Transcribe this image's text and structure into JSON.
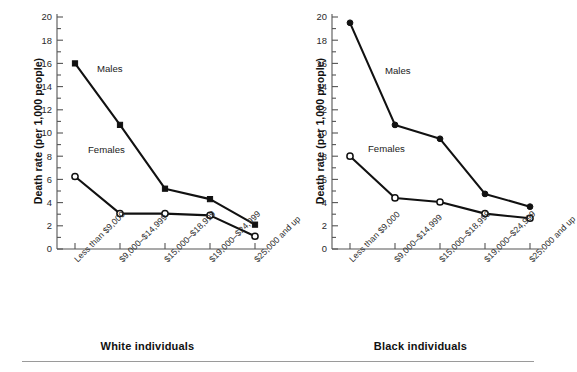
{
  "figure": {
    "rule_color": "#9a9a9a",
    "line_color": "#111111",
    "axis_color": "#555555"
  },
  "chart_data": [
    {
      "type": "line",
      "title": "White individuals",
      "xlabel": "",
      "ylabel": "Death rate (per 1,000 people)",
      "ylim": [
        0,
        20
      ],
      "ytick_step": 2,
      "yticks": [
        0,
        2,
        4,
        6,
        8,
        10,
        12,
        14,
        16,
        18,
        20
      ],
      "grid": false,
      "legend_position": "inline-annotation",
      "categories": [
        "Less than $9,000",
        "$9,000–$14,999",
        "$15,000–$18,999",
        "$19,000–$24,999",
        "$25,000 and up"
      ],
      "series": [
        {
          "name": "Males",
          "marker": "filled-square",
          "values": [
            16.0,
            10.7,
            5.2,
            4.3,
            2.1
          ]
        },
        {
          "name": "Females",
          "marker": "open-circle",
          "values": [
            6.25,
            3.05,
            3.05,
            2.9,
            1.1
          ]
        }
      ]
    },
    {
      "type": "line",
      "title": "Black individuals",
      "xlabel": "",
      "ylabel": "Death rate (per 1,000 people)",
      "ylim": [
        0,
        20
      ],
      "ytick_step": 2,
      "yticks": [
        0,
        2,
        4,
        6,
        8,
        10,
        12,
        14,
        16,
        18,
        20
      ],
      "grid": false,
      "legend_position": "inline-annotation",
      "categories": [
        "Less than $9,000",
        "$9,000–$14,999",
        "$15,000–$18,999",
        "$19,000–$24,999",
        "$25,000 and up"
      ],
      "series": [
        {
          "name": "Males",
          "marker": "filled-circle",
          "values": [
            19.5,
            10.7,
            9.5,
            4.75,
            3.65
          ]
        },
        {
          "name": "Females",
          "marker": "open-circle",
          "values": [
            8.0,
            4.4,
            4.05,
            3.05,
            2.65
          ]
        }
      ]
    }
  ]
}
